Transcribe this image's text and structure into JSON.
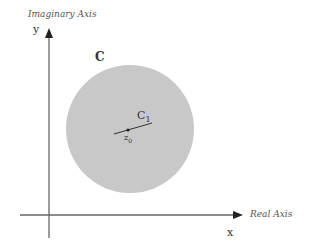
{
  "diagram": {
    "y_axis": {
      "title": "Imaginary Axis",
      "symbol": "y"
    },
    "x_axis": {
      "title": "Real Axis",
      "symbol": "x"
    },
    "circle": {
      "label": "C",
      "fill": "#c8c8c8"
    },
    "inner_contour": {
      "label": "C",
      "subscript": "1"
    },
    "center_point": {
      "label": "z",
      "subscript": "0"
    }
  }
}
